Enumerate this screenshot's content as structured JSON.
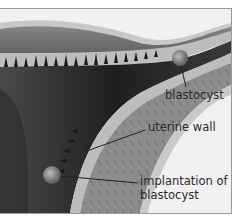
{
  "diagram": {
    "labels": {
      "blastocyst": "blastocyst",
      "uterine_wall": "uterine wall",
      "implantation_line1": "implantation of",
      "implantation_line2": "blastocyst"
    },
    "colors": {
      "background": "#f1f1f1",
      "tissue_dark": "#2e2e2e",
      "tissue_mid": "#6f6f6f",
      "tissue_light": "#b4b4b4",
      "lining": "#c9c9c9",
      "frame_border": "#9a9a9a"
    }
  }
}
